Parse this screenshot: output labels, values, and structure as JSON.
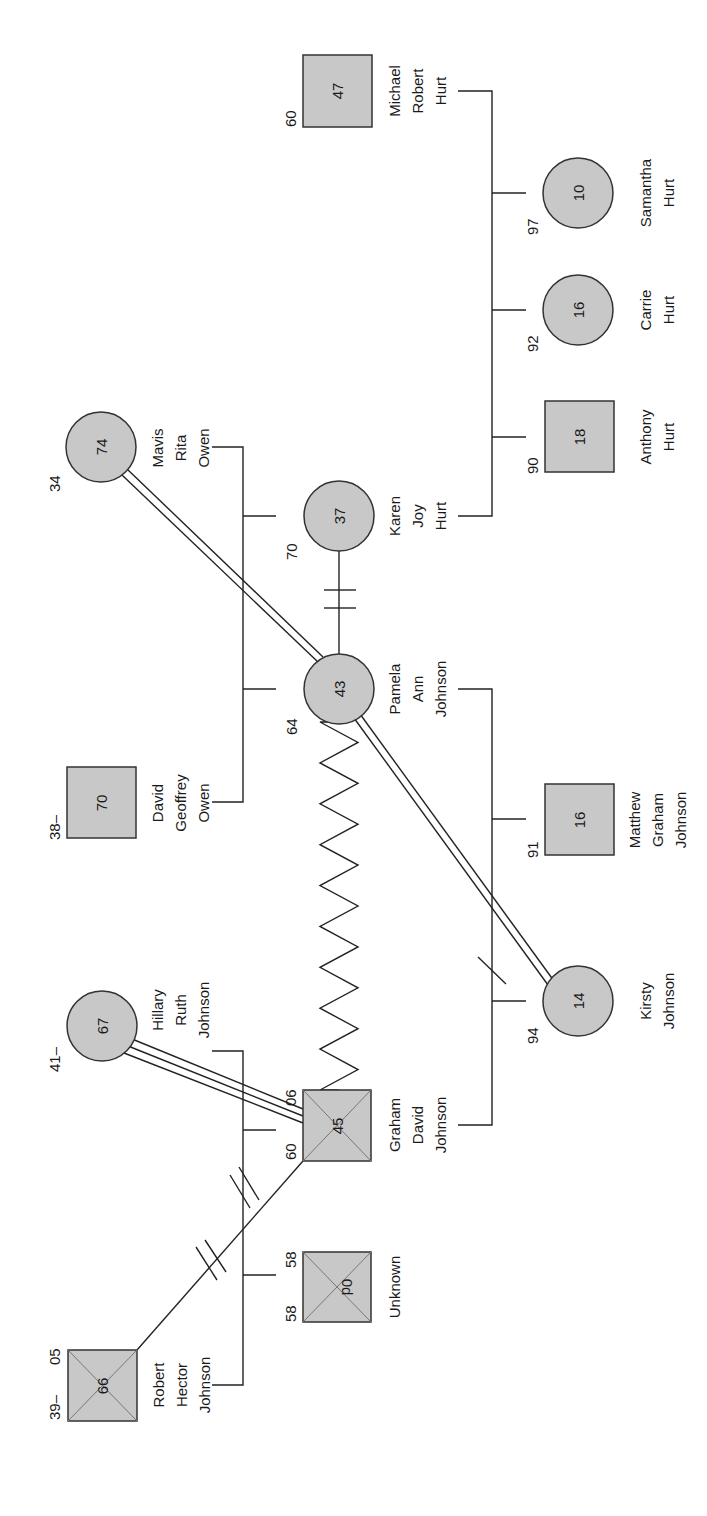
{
  "diagram": {
    "type": "genogram",
    "orientation": "rotated-90-ccw",
    "colors": {
      "fill": "#c8c8c8",
      "stroke": "#333333",
      "background": "#ffffff"
    },
    "people": [
      {
        "id": "robert",
        "name_lines": [
          "Robert",
          "Hector",
          "Johnson"
        ],
        "sex": "male",
        "deceased": true,
        "age": "66",
        "birth": "39–",
        "death": "05"
      },
      {
        "id": "unknown",
        "name_lines": [
          "Unknown"
        ],
        "sex": "male",
        "deceased": true,
        "age": "0d",
        "birth": "58",
        "death": "58"
      },
      {
        "id": "graham",
        "name_lines": [
          "Graham",
          "David",
          "Johnson"
        ],
        "sex": "male",
        "deceased": true,
        "age": "45",
        "birth": "60",
        "death": "06"
      },
      {
        "id": "hillary",
        "name_lines": [
          "Hillary",
          "Ruth",
          "Johnson"
        ],
        "sex": "female",
        "deceased": false,
        "age": "67",
        "birth": "41–",
        "death": ""
      },
      {
        "id": "david",
        "name_lines": [
          "David",
          "Geoffrey",
          "Owen"
        ],
        "sex": "male",
        "deceased": false,
        "age": "70",
        "birth": "38–",
        "death": ""
      },
      {
        "id": "mavis",
        "name_lines": [
          "Mavis",
          "Rita",
          "Owen"
        ],
        "sex": "female",
        "deceased": false,
        "age": "74",
        "birth": "34",
        "death": ""
      },
      {
        "id": "pamela",
        "name_lines": [
          "Pamela",
          "Ann",
          "Johnson"
        ],
        "sex": "female",
        "deceased": false,
        "age": "43",
        "birth": "64",
        "death": ""
      },
      {
        "id": "karen",
        "name_lines": [
          "Karen",
          "Joy",
          "Hurt"
        ],
        "sex": "female",
        "deceased": false,
        "age": "37",
        "birth": "70",
        "death": ""
      },
      {
        "id": "matthew",
        "name_lines": [
          "Matthew",
          "Graham",
          "Johnson"
        ],
        "sex": "male",
        "deceased": false,
        "age": "16",
        "birth": "91",
        "death": ""
      },
      {
        "id": "kirsty",
        "name_lines": [
          "Kirsty",
          "Johnson"
        ],
        "sex": "female",
        "deceased": false,
        "age": "14",
        "birth": "94",
        "death": ""
      },
      {
        "id": "anthony",
        "name_lines": [
          "Anthony",
          "Hurt"
        ],
        "sex": "male",
        "deceased": false,
        "age": "18",
        "birth": "90",
        "death": ""
      },
      {
        "id": "carrie",
        "name_lines": [
          "Carrie",
          "Hurt"
        ],
        "sex": "female",
        "deceased": false,
        "age": "16",
        "birth": "92",
        "death": ""
      },
      {
        "id": "samantha",
        "name_lines": [
          "Samantha",
          "Hurt"
        ],
        "sex": "female",
        "deceased": false,
        "age": "10",
        "birth": "97",
        "death": ""
      },
      {
        "id": "michael",
        "name_lines": [
          "Michael",
          "Robert",
          "Hurt"
        ],
        "sex": "male",
        "deceased": false,
        "age": "47",
        "birth": "60",
        "death": ""
      }
    ],
    "relationships": [
      {
        "from": "robert",
        "to": "hillary",
        "type": "divorced-marriage"
      },
      {
        "from": "david",
        "to": "mavis",
        "type": "marriage"
      },
      {
        "from": "graham",
        "to": "pamela",
        "type": "marriage"
      },
      {
        "from": "karen",
        "to": "michael",
        "type": "marriage"
      },
      {
        "from": "robert",
        "to": "graham",
        "type": "cutoff"
      },
      {
        "from": "hillary",
        "to": "graham",
        "type": "fused"
      },
      {
        "from": "graham",
        "to": "pamela",
        "type": "conflict"
      },
      {
        "from": "mavis",
        "to": "pamela",
        "type": "close"
      },
      {
        "from": "pamela",
        "to": "karen",
        "type": "cutoff"
      },
      {
        "from": "pamela",
        "to": "kirsty",
        "type": "close"
      }
    ]
  }
}
